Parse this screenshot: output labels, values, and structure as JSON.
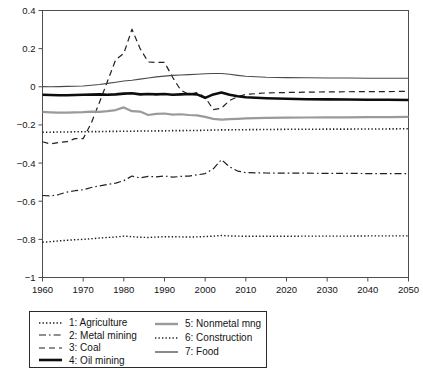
{
  "chart_data": {
    "type": "line",
    "title": "",
    "subtitle": "",
    "xlabel": "",
    "ylabel": "",
    "xlim": [
      1960,
      2050
    ],
    "ylim": [
      -1,
      0.4
    ],
    "grid": false,
    "legend_position": "below-left",
    "x_ticks": [
      "1960",
      "1970",
      "1980",
      "1990",
      "2000",
      "2010",
      "2020",
      "2030",
      "2040",
      "2050"
    ],
    "x_tick_values": [
      1960,
      1970,
      1980,
      1990,
      2000,
      2010,
      2020,
      2030,
      2040,
      2050
    ],
    "y_ticks": [
      "0.4",
      "0.2",
      "0",
      "-0.2",
      "-0.4",
      "-0.6",
      "-0.8",
      "-1"
    ],
    "y_tick_values": [
      0.4,
      0.2,
      0,
      -0.2,
      -0.4,
      -0.6,
      -0.8,
      -1
    ],
    "x": [
      1960,
      1962,
      1964,
      1966,
      1968,
      1970,
      1972,
      1974,
      1976,
      1978,
      1980,
      1982,
      1984,
      1986,
      1988,
      1990,
      1992,
      1994,
      1996,
      1998,
      2000,
      2002,
      2004,
      2006,
      2008,
      2010,
      2015,
      2020,
      2025,
      2030,
      2035,
      2040,
      2045,
      2050
    ],
    "series": [
      {
        "name": "1: Agriculture",
        "key": "agriculture",
        "style": "dotted",
        "color": "#1a1a1a",
        "width": 1.4,
        "values": [
          -0.815,
          -0.812,
          -0.808,
          -0.805,
          -0.802,
          -0.8,
          -0.797,
          -0.793,
          -0.79,
          -0.788,
          -0.783,
          -0.786,
          -0.789,
          -0.79,
          -0.788,
          -0.786,
          -0.786,
          -0.787,
          -0.788,
          -0.787,
          -0.785,
          -0.783,
          -0.78,
          -0.782,
          -0.783,
          -0.784,
          -0.784,
          -0.784,
          -0.783,
          -0.783,
          -0.783,
          -0.782,
          -0.782,
          -0.782
        ]
      },
      {
        "name": "2: Metal mining",
        "key": "metal_mining",
        "style": "dashdot",
        "color": "#1f1f1f",
        "width": 1.2,
        "values": [
          -0.57,
          -0.572,
          -0.565,
          -0.552,
          -0.545,
          -0.54,
          -0.528,
          -0.52,
          -0.512,
          -0.505,
          -0.492,
          -0.468,
          -0.478,
          -0.47,
          -0.472,
          -0.468,
          -0.474,
          -0.47,
          -0.468,
          -0.462,
          -0.455,
          -0.43,
          -0.382,
          -0.42,
          -0.442,
          -0.45,
          -0.452,
          -0.453,
          -0.453,
          -0.454,
          -0.454,
          -0.455,
          -0.455,
          -0.455
        ]
      },
      {
        "name": "3: Coal",
        "key": "coal",
        "style": "dashed",
        "color": "#1f1f1f",
        "width": 1.2,
        "values": [
          -0.288,
          -0.3,
          -0.292,
          -0.288,
          -0.272,
          -0.272,
          -0.19,
          -0.082,
          0.03,
          0.142,
          0.175,
          0.302,
          0.2,
          0.13,
          0.128,
          0.128,
          0.05,
          -0.018,
          -0.04,
          -0.03,
          -0.055,
          -0.12,
          -0.112,
          -0.072,
          -0.052,
          -0.04,
          -0.032,
          -0.03,
          -0.028,
          -0.027,
          -0.026,
          -0.025,
          -0.025,
          -0.024
        ]
      },
      {
        "name": "4: Oil mining",
        "key": "oil_mining",
        "style": "solid-thick",
        "color": "#0d0d0d",
        "width": 2.6,
        "values": [
          -0.042,
          -0.043,
          -0.044,
          -0.044,
          -0.043,
          -0.042,
          -0.041,
          -0.04,
          -0.042,
          -0.04,
          -0.036,
          -0.034,
          -0.04,
          -0.038,
          -0.04,
          -0.038,
          -0.042,
          -0.04,
          -0.038,
          -0.04,
          -0.058,
          -0.04,
          -0.03,
          -0.042,
          -0.05,
          -0.055,
          -0.06,
          -0.063,
          -0.065,
          -0.066,
          -0.067,
          -0.068,
          -0.068,
          -0.069
        ]
      },
      {
        "name": "5: Nonmetal mng",
        "key": "nonmetal_mining",
        "style": "solid-gray",
        "color": "#9a9a9a",
        "width": 2.2,
        "values": [
          -0.132,
          -0.134,
          -0.136,
          -0.136,
          -0.134,
          -0.133,
          -0.13,
          -0.132,
          -0.128,
          -0.122,
          -0.108,
          -0.128,
          -0.13,
          -0.148,
          -0.142,
          -0.14,
          -0.146,
          -0.144,
          -0.148,
          -0.15,
          -0.158,
          -0.168,
          -0.172,
          -0.17,
          -0.168,
          -0.166,
          -0.163,
          -0.162,
          -0.161,
          -0.16,
          -0.16,
          -0.159,
          -0.159,
          -0.158
        ]
      },
      {
        "name": "6: Construction",
        "key": "construction",
        "style": "dotted-fine",
        "color": "#1a1a1a",
        "width": 1.6,
        "values": [
          -0.238,
          -0.238,
          -0.237,
          -0.237,
          -0.236,
          -0.236,
          -0.235,
          -0.235,
          -0.234,
          -0.234,
          -0.233,
          -0.233,
          -0.232,
          -0.232,
          -0.231,
          -0.231,
          -0.23,
          -0.23,
          -0.229,
          -0.229,
          -0.228,
          -0.227,
          -0.226,
          -0.226,
          -0.225,
          -0.225,
          -0.224,
          -0.223,
          -0.223,
          -0.222,
          -0.222,
          -0.221,
          -0.221,
          -0.22
        ]
      },
      {
        "name": "7: Food",
        "key": "food",
        "style": "solid-thin",
        "color": "#4a4a4a",
        "width": 1.1,
        "values": [
          0.001,
          0.0,
          0.001,
          0.002,
          0.003,
          0.004,
          0.008,
          0.012,
          0.018,
          0.024,
          0.03,
          0.034,
          0.04,
          0.046,
          0.052,
          0.056,
          0.06,
          0.062,
          0.064,
          0.066,
          0.068,
          0.07,
          0.07,
          0.066,
          0.06,
          0.055,
          0.05,
          0.048,
          0.047,
          0.046,
          0.046,
          0.045,
          0.045,
          0.045
        ]
      }
    ]
  },
  "legend": {
    "columns": [
      {
        "entries": [
          {
            "label": "1: Agriculture",
            "style": "dotted",
            "color": "#1a1a1a",
            "width": 1.4
          },
          {
            "label": "2: Metal mining",
            "style": "dashdot",
            "color": "#1f1f1f",
            "width": 1.2
          },
          {
            "label": "3: Coal",
            "style": "dashed",
            "color": "#1f1f1f",
            "width": 1.2
          },
          {
            "label": "4: Oil mining",
            "style": "solid-thick",
            "color": "#0d0d0d",
            "width": 2.6
          }
        ]
      },
      {
        "entries": [
          {
            "label": "5: Nonmetal mng",
            "style": "solid-gray",
            "color": "#9a9a9a",
            "width": 2.4
          },
          {
            "label": "6: Construction",
            "style": "dotted-fine",
            "color": "#1a1a1a",
            "width": 1.6
          },
          {
            "label": "7: Food",
            "style": "solid-thin",
            "color": "#4a4a4a",
            "width": 1.3
          }
        ]
      }
    ]
  }
}
